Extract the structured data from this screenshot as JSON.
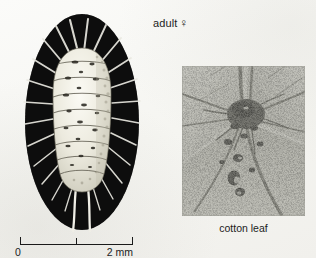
{
  "figure": {
    "background_color": "#f8f8f6",
    "ink_color": "#141414",
    "width": 316,
    "height": 258
  },
  "specimen_panel": {
    "label_text": "adult",
    "sex_symbol": "♀",
    "sex_name": "female",
    "subject": "mealybug adult female, dorsal view",
    "body_fill": "#efeee6",
    "margin_fill": "#0d0d0d",
    "filament_color": "#e8e7df",
    "segment_count": 9,
    "caudal_filament_count": 2
  },
  "photo_panel": {
    "caption": "cotton leaf",
    "subject": "cotton leaf underside with mealybug colony at vein junction",
    "tone_light": "#dcdcd6",
    "tone_mid": "#9a9a92",
    "tone_dark": "#2a2a26"
  },
  "scale_bar": {
    "start_label": "0",
    "end_label": "2 mm",
    "tick_count": 3,
    "major_ticks": [
      "0",
      "1",
      "2"
    ],
    "units": "mm",
    "span_value": 2,
    "bar_color": "#1a1a1a"
  }
}
